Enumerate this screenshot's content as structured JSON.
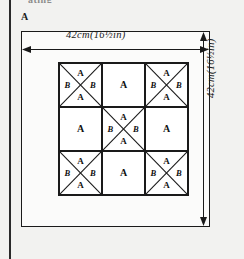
{
  "page": {
    "cropped_header_text": "ating",
    "figure_caption": "A",
    "background_color": "#f2f2f0",
    "ink_color": "#1a1a1a"
  },
  "dimensions": {
    "width_label": "42cm(16½in)",
    "height_label": "42cm(16½in)",
    "width_value": "42",
    "width_unit": "cm",
    "width_imperial": "16½in",
    "height_value": "42",
    "height_unit": "cm",
    "height_imperial": "16½in"
  },
  "block": {
    "rows": 3,
    "columns": 3,
    "cells": [
      {
        "position": "top-left",
        "type": "quarter-square-triangle",
        "labels": {
          "top": "A",
          "left": "B",
          "right": "B",
          "bottom": "A"
        }
      },
      {
        "position": "top-center",
        "type": "plain-square",
        "labels": {
          "center": "A"
        }
      },
      {
        "position": "top-right",
        "type": "quarter-square-triangle",
        "labels": {
          "top": "A",
          "left": "B",
          "right": "B",
          "bottom": "A"
        }
      },
      {
        "position": "middle-left",
        "type": "plain-square",
        "labels": {
          "center": "A"
        }
      },
      {
        "position": "center",
        "type": "quarter-square-triangle",
        "labels": {
          "top": "A",
          "left": "B",
          "right": "B",
          "bottom": "A"
        }
      },
      {
        "position": "middle-right",
        "type": "plain-square",
        "labels": {
          "center": "A"
        }
      },
      {
        "position": "bottom-left",
        "type": "quarter-square-triangle",
        "labels": {
          "top": "A",
          "left": "B",
          "right": "B",
          "bottom": "A"
        }
      },
      {
        "position": "bottom-center",
        "type": "plain-square",
        "labels": {
          "center": "A"
        }
      },
      {
        "position": "bottom-right",
        "type": "quarter-square-triangle",
        "labels": {
          "top": "A",
          "left": "B",
          "right": "B",
          "bottom": "A"
        }
      }
    ]
  }
}
